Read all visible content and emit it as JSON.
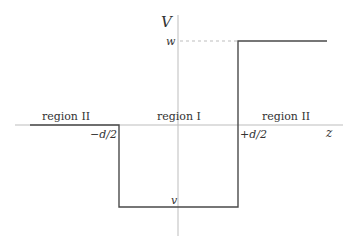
{
  "diagram": {
    "axes": {
      "vertical_label": "V",
      "horizontal_label": "z"
    },
    "levels": {
      "upper": "w",
      "lower": "v"
    },
    "boundaries": {
      "left": "−d/2",
      "right": "+d/2"
    },
    "regions": [
      {
        "label": "region II",
        "side": "left"
      },
      {
        "label": "region I",
        "side": "center"
      },
      {
        "label": "region II",
        "side": "right"
      }
    ],
    "colors": {
      "axis": "#bdbdbd",
      "potential": "#4a4a4a",
      "dashed": "#bdbdbd",
      "text": "#333333"
    }
  }
}
